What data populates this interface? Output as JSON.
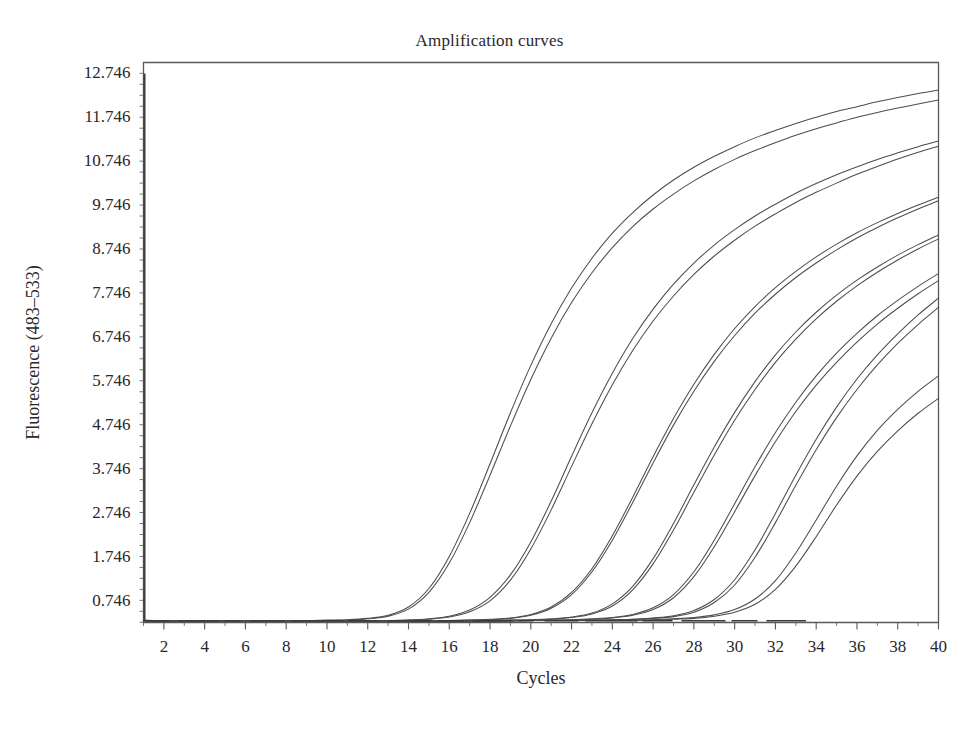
{
  "chart_data": {
    "type": "line",
    "title": "Amplification curves",
    "xlabel": "Cycles",
    "ylabel": "Fluorescence (483–533)",
    "xlim": [
      1,
      40
    ],
    "ylim": [
      0.246,
      12.996
    ],
    "grid": false,
    "legend": "none",
    "x_ticks": [
      2,
      4,
      6,
      8,
      10,
      12,
      14,
      16,
      18,
      20,
      22,
      24,
      26,
      28,
      30,
      32,
      34,
      36,
      38,
      40
    ],
    "y_ticks": [
      0.746,
      1.746,
      2.746,
      3.746,
      4.746,
      5.746,
      6.746,
      7.746,
      8.746,
      9.746,
      10.746,
      11.746,
      12.746
    ],
    "x_minor_tick_step": 1,
    "y_minor_tick_step": 0.25,
    "x_tick_labels": [
      "2",
      "4",
      "6",
      "8",
      "10",
      "12",
      "14",
      "16",
      "18",
      "20",
      "22",
      "24",
      "26",
      "28",
      "30",
      "32",
      "34",
      "36",
      "38",
      "40"
    ],
    "y_tick_labels": [
      "0.746",
      "1.746",
      "2.746",
      "3.746",
      "4.746",
      "5.746",
      "6.746",
      "7.746",
      "8.746",
      "9.746",
      "10.746",
      "11.746",
      "12.746"
    ],
    "line_color": "#4d4d4d",
    "axis_color": "#58595b",
    "background": "#ffffff",
    "annotations": [
      {
        "name": "cycle-1-spike",
        "description": "Vertical spike artifact at cycle 1 rising from baseline to 12.746",
        "x": 1.05,
        "y_from": 0.28,
        "y_to": 12.746
      }
    ],
    "x": [
      1,
      2,
      3,
      4,
      5,
      6,
      7,
      8,
      9,
      10,
      11,
      12,
      13,
      14,
      15,
      16,
      17,
      18,
      19,
      20,
      21,
      22,
      23,
      24,
      25,
      26,
      27,
      28,
      29,
      30,
      31,
      32,
      33,
      34,
      35,
      36,
      37,
      38,
      39,
      40
    ],
    "series": [
      {
        "name": "Sample 1a",
        "ct": 13.8,
        "values": [
          0.3,
          0.29,
          0.29,
          0.29,
          0.29,
          0.29,
          0.29,
          0.29,
          0.29,
          0.3,
          0.31,
          0.34,
          0.41,
          0.6,
          1.02,
          1.75,
          2.73,
          3.86,
          5.02,
          6.1,
          7.05,
          7.86,
          8.54,
          9.11,
          9.58,
          9.98,
          10.32,
          10.61,
          10.86,
          11.08,
          11.28,
          11.45,
          11.61,
          11.75,
          11.88,
          11.99,
          12.1,
          12.2,
          12.29,
          12.37
        ]
      },
      {
        "name": "Sample 1b",
        "ct": 14.1,
        "values": [
          0.29,
          0.28,
          0.28,
          0.28,
          0.28,
          0.28,
          0.28,
          0.28,
          0.29,
          0.29,
          0.3,
          0.33,
          0.39,
          0.55,
          0.93,
          1.6,
          2.52,
          3.6,
          4.72,
          5.78,
          6.72,
          7.53,
          8.21,
          8.78,
          9.26,
          9.66,
          10.0,
          10.3,
          10.56,
          10.79,
          10.99,
          11.17,
          11.34,
          11.49,
          11.62,
          11.75,
          11.86,
          11.96,
          12.05,
          12.14
        ]
      },
      {
        "name": "Sample 2a",
        "ct": 17.5,
        "values": [
          0.29,
          0.28,
          0.28,
          0.28,
          0.28,
          0.28,
          0.28,
          0.28,
          0.28,
          0.28,
          0.28,
          0.29,
          0.29,
          0.3,
          0.33,
          0.39,
          0.53,
          0.82,
          1.33,
          2.08,
          3.01,
          4.03,
          5.02,
          5.92,
          6.71,
          7.38,
          7.95,
          8.43,
          8.84,
          9.19,
          9.5,
          9.77,
          10.02,
          10.24,
          10.44,
          10.62,
          10.79,
          10.94,
          11.08,
          11.21
        ]
      },
      {
        "name": "Sample 2b",
        "ct": 17.8,
        "values": [
          0.29,
          0.28,
          0.28,
          0.28,
          0.28,
          0.28,
          0.28,
          0.28,
          0.28,
          0.28,
          0.28,
          0.28,
          0.29,
          0.3,
          0.32,
          0.37,
          0.49,
          0.74,
          1.21,
          1.92,
          2.81,
          3.8,
          4.77,
          5.66,
          6.44,
          7.11,
          7.68,
          8.17,
          8.59,
          8.95,
          9.27,
          9.55,
          9.81,
          10.04,
          10.25,
          10.45,
          10.63,
          10.8,
          10.95,
          11.09
        ]
      },
      {
        "name": "Sample 3a",
        "ct": 21.2,
        "values": [
          0.29,
          0.28,
          0.28,
          0.28,
          0.28,
          0.28,
          0.28,
          0.28,
          0.28,
          0.28,
          0.28,
          0.28,
          0.28,
          0.28,
          0.29,
          0.29,
          0.3,
          0.32,
          0.35,
          0.43,
          0.6,
          0.93,
          1.47,
          2.22,
          3.1,
          4.02,
          4.89,
          5.67,
          6.35,
          6.94,
          7.44,
          7.87,
          8.24,
          8.57,
          8.86,
          9.12,
          9.35,
          9.56,
          9.75,
          9.93
        ]
      },
      {
        "name": "Sample 3b",
        "ct": 21.4,
        "values": [
          0.29,
          0.28,
          0.28,
          0.28,
          0.28,
          0.28,
          0.28,
          0.28,
          0.28,
          0.28,
          0.28,
          0.28,
          0.28,
          0.28,
          0.29,
          0.29,
          0.3,
          0.31,
          0.34,
          0.41,
          0.57,
          0.88,
          1.4,
          2.12,
          2.98,
          3.88,
          4.74,
          5.51,
          6.19,
          6.78,
          7.29,
          7.72,
          8.1,
          8.43,
          8.73,
          9.0,
          9.24,
          9.46,
          9.66,
          9.85
        ]
      },
      {
        "name": "Sample 4a",
        "ct": 24.6,
        "values": [
          0.29,
          0.28,
          0.28,
          0.28,
          0.28,
          0.28,
          0.28,
          0.28,
          0.28,
          0.28,
          0.28,
          0.28,
          0.28,
          0.28,
          0.28,
          0.28,
          0.29,
          0.29,
          0.3,
          0.31,
          0.33,
          0.37,
          0.46,
          0.67,
          1.07,
          1.7,
          2.5,
          3.38,
          4.24,
          5.03,
          5.73,
          6.34,
          6.86,
          7.31,
          7.7,
          8.04,
          8.34,
          8.61,
          8.85,
          9.07
        ]
      },
      {
        "name": "Sample 4b",
        "ct": 24.9,
        "values": [
          0.29,
          0.28,
          0.28,
          0.28,
          0.28,
          0.28,
          0.28,
          0.28,
          0.28,
          0.28,
          0.28,
          0.28,
          0.28,
          0.28,
          0.28,
          0.28,
          0.29,
          0.29,
          0.3,
          0.31,
          0.32,
          0.36,
          0.44,
          0.62,
          0.99,
          1.58,
          2.35,
          3.21,
          4.06,
          4.85,
          5.55,
          6.17,
          6.7,
          7.16,
          7.56,
          7.91,
          8.22,
          8.5,
          8.75,
          8.98
        ]
      },
      {
        "name": "Sample 5a",
        "ct": 27.9,
        "values": [
          0.29,
          0.28,
          0.28,
          0.28,
          0.28,
          0.28,
          0.28,
          0.28,
          0.28,
          0.28,
          0.28,
          0.28,
          0.28,
          0.28,
          0.28,
          0.28,
          0.28,
          0.29,
          0.29,
          0.29,
          0.3,
          0.31,
          0.33,
          0.36,
          0.43,
          0.58,
          0.88,
          1.4,
          2.12,
          2.95,
          3.79,
          4.57,
          5.26,
          5.86,
          6.38,
          6.83,
          7.23,
          7.58,
          7.9,
          8.19
        ]
      },
      {
        "name": "Sample 5b",
        "ct": 28.2,
        "values": [
          0.29,
          0.28,
          0.28,
          0.28,
          0.28,
          0.28,
          0.28,
          0.28,
          0.28,
          0.28,
          0.28,
          0.28,
          0.28,
          0.28,
          0.28,
          0.28,
          0.28,
          0.29,
          0.29,
          0.29,
          0.3,
          0.31,
          0.32,
          0.35,
          0.41,
          0.54,
          0.81,
          1.29,
          1.97,
          2.77,
          3.59,
          4.36,
          5.05,
          5.65,
          6.17,
          6.63,
          7.04,
          7.4,
          7.73,
          8.03
        ]
      },
      {
        "name": "Sample 6a",
        "ct": 31.0,
        "values": [
          0.29,
          0.28,
          0.28,
          0.28,
          0.28,
          0.28,
          0.28,
          0.28,
          0.28,
          0.28,
          0.28,
          0.28,
          0.28,
          0.28,
          0.28,
          0.28,
          0.28,
          0.28,
          0.29,
          0.29,
          0.29,
          0.29,
          0.3,
          0.31,
          0.32,
          0.35,
          0.4,
          0.52,
          0.77,
          1.22,
          1.9,
          2.73,
          3.6,
          4.42,
          5.15,
          5.79,
          6.34,
          6.82,
          7.25,
          7.63
        ]
      },
      {
        "name": "Sample 6b",
        "ct": 31.4,
        "values": [
          0.29,
          0.28,
          0.28,
          0.28,
          0.28,
          0.28,
          0.28,
          0.28,
          0.28,
          0.28,
          0.28,
          0.28,
          0.28,
          0.28,
          0.28,
          0.28,
          0.28,
          0.28,
          0.29,
          0.29,
          0.29,
          0.29,
          0.3,
          0.3,
          0.32,
          0.34,
          0.38,
          0.48,
          0.7,
          1.1,
          1.73,
          2.52,
          3.37,
          4.18,
          4.91,
          5.55,
          6.11,
          6.6,
          7.03,
          7.42
        ]
      },
      {
        "name": "Sample 7a",
        "ct": 33.9,
        "values": [
          0.29,
          0.28,
          0.28,
          0.28,
          0.28,
          0.28,
          0.28,
          0.28,
          0.28,
          0.28,
          0.28,
          0.28,
          0.28,
          0.28,
          0.28,
          0.28,
          0.28,
          0.28,
          0.28,
          0.29,
          0.29,
          0.29,
          0.29,
          0.3,
          0.3,
          0.31,
          0.33,
          0.36,
          0.42,
          0.54,
          0.78,
          1.2,
          1.83,
          2.58,
          3.35,
          4.04,
          4.62,
          5.1,
          5.51,
          5.86
        ]
      },
      {
        "name": "Sample 7b",
        "ct": 34.6,
        "values": [
          0.29,
          0.28,
          0.28,
          0.28,
          0.28,
          0.28,
          0.28,
          0.28,
          0.28,
          0.28,
          0.28,
          0.28,
          0.28,
          0.28,
          0.28,
          0.28,
          0.28,
          0.28,
          0.28,
          0.29,
          0.29,
          0.29,
          0.29,
          0.29,
          0.3,
          0.3,
          0.32,
          0.34,
          0.39,
          0.48,
          0.66,
          1.0,
          1.53,
          2.2,
          2.92,
          3.58,
          4.14,
          4.61,
          5.01,
          5.35
        ]
      }
    ]
  }
}
